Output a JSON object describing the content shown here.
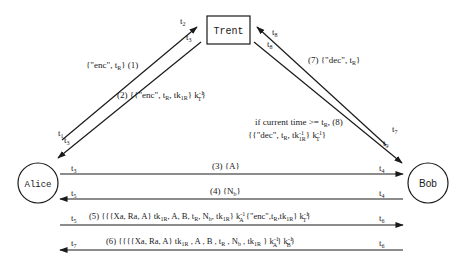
{
  "diagram": {
    "type": "protocol-sequence",
    "colors": {
      "ink": "#1a1a1a",
      "background": "#ffffff"
    },
    "entities": {
      "trent": {
        "label": "Trent",
        "shape": "rectangle"
      },
      "alice": {
        "label": "Alice",
        "shape": "circle"
      },
      "bob": {
        "label": "Bob",
        "shape": "circle"
      }
    },
    "messages": [
      {
        "id": "1",
        "from": "Alice",
        "to": "Trent",
        "text": "{\"enc\", t_R} (1)",
        "parts": {
          "open": "{\"enc\", t",
          "sub": "R",
          "close": "}  (1)"
        },
        "t_send": "t1",
        "t_recv": "t2"
      },
      {
        "id": "2",
        "from": "Trent",
        "to": "Alice",
        "text": "(2) {{\"enc\", t_R, tk_1R} k_T^-1}",
        "parts": {
          "a": "(2) {{\"enc\", t",
          "sub1": "R",
          "b": ", tk",
          "sub2": "1R",
          "c": "} k",
          "sup3": "-1",
          "sub3": "T",
          "d": "}"
        },
        "t_send": "t2",
        "t_recv": "t3"
      },
      {
        "id": "3",
        "from": "Alice",
        "to": "Bob",
        "text": "(3) {A}",
        "t_send": "t3",
        "t_recv": "t4"
      },
      {
        "id": "4",
        "from": "Bob",
        "to": "Alice",
        "text": "(4) {N_b}",
        "parts": {
          "a": "(4) {N",
          "sub": "b",
          "b": "}"
        },
        "t_send": "t4",
        "t_recv": "t5"
      },
      {
        "id": "5",
        "from": "Alice",
        "to": "Bob",
        "text": "(5) {{{Xa, Ra, A} tk_1R, A, B, t_R, N_b, tk_1R} k_A^-1 {\"enc\", t_R, tk_1R} k_T^-1}",
        "t_send": "t5",
        "t_recv": "t6"
      },
      {
        "id": "6",
        "from": "Bob",
        "to": "Alice",
        "text": "(6) {{{{Xa, Ra, A} tk_1R, A, B, t_R, N_b, tk_1R} k_A^-1} k_B^-1}",
        "t_send": "t6",
        "t_recv": "t7"
      },
      {
        "id": "7",
        "from": "Bob",
        "to": "Trent",
        "text": "(7) {\"dec\", t_R}",
        "parts": {
          "a": "(7)  {\"dec\", t",
          "sub": "R",
          "b": "}"
        },
        "t_send": "t7",
        "t_recv": "t8"
      },
      {
        "id": "8",
        "from": "Trent",
        "to": "Bob",
        "text": "if current time >= t_R, (8) {{\"dec\", t_R, tk_1R^-1} k_T^-1}",
        "condition": "if current time >= t",
        "t_send": "t8",
        "t_recv": "t9"
      }
    ],
    "time_labels": {
      "t1": "t",
      "t2": "t",
      "t3": "t",
      "t4": "t",
      "t5": "t",
      "t6": "t",
      "t7": "t",
      "t8": "t",
      "t9": "t",
      "s1": "1",
      "s2": "2",
      "s3": "3",
      "s4": "4",
      "s5": "5",
      "s6": "6",
      "s7": "7",
      "s8": "8",
      "s9": "9"
    },
    "labels": {
      "m1_open": "{\"enc\", t",
      "m1_sub": "R",
      "m1_close": "}  (1)",
      "m2_a": "(2) {{\"enc\", t",
      "m2_sub1": "R",
      "m2_b": ", tk",
      "m2_sub2": "1R",
      "m2_c": "} k",
      "m2_sup": "-1",
      "m2_sub3": "T",
      "m2_d": "}",
      "m7_a": "(7)  {\"dec\", t",
      "m7_sub": "R",
      "m7_b": "}",
      "m8_cond": "if current time >= t",
      "m8_cond_sub": "R",
      "m8_cond_end": ",  (8)",
      "m8_a": "{{\"dec\", t",
      "m8_sub1": "R",
      "m8_b": ", tk",
      "m8_sup2": "-1",
      "m8_sub2": "1R",
      "m8_c": "} k",
      "m8_sup3": "-1",
      "m8_sub3": "T",
      "m8_d": " }",
      "m3": "(3) {A}",
      "m4_a": "(4) {N",
      "m4_sub": "b",
      "m4_b": "}",
      "m5_a": "(5)  {{{Xa, Ra, A} tk",
      "m5_s1": "1R",
      "m5_b": ", A, B, t",
      "m5_s2": "R",
      "m5_c": ", N",
      "m5_s3": "b",
      "m5_d": ", tk",
      "m5_s4": "1R",
      "m5_e": "} k",
      "m5_sup5": "-1",
      "m5_s5": "A",
      "m5_f": " {\"enc\",t",
      "m5_s6": "R",
      "m5_g": ",tk",
      "m5_s7": "1R",
      "m5_h": "} k",
      "m5_sup8": "-1",
      "m5_s8": "T",
      "m5_i": "}",
      "m6_a": "(6)  {{{{Xa, Ra, A} tk",
      "m6_s1": "1R",
      "m6_b": " , A , B , t",
      "m6_s2": "R",
      "m6_c": " , N",
      "m6_s3": "b",
      "m6_d": " , tk",
      "m6_s4": "1R",
      "m6_e": " } k",
      "m6_sup5": "-1",
      "m6_s5": "A",
      "m6_f": "} k",
      "m6_sup6": "-1",
      "m6_s6": "B",
      "m6_g": "}"
    }
  }
}
